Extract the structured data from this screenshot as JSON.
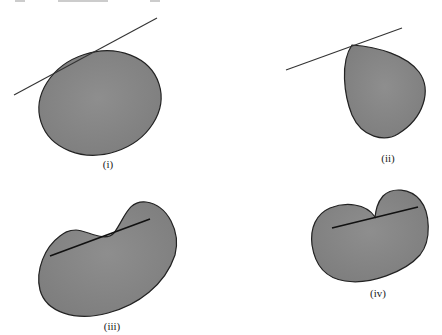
{
  "figure": {
    "fill_color": "#8c8c8c",
    "outline_color": "#222222",
    "panels": [
      {
        "id": "i",
        "label": "(i)",
        "shape": "ellipse",
        "line_type": "tangent line touching top-left of boundary"
      },
      {
        "id": "ii",
        "label": "(ii)",
        "shape": "teardrop",
        "line_type": "line through pointed apex"
      },
      {
        "id": "iii",
        "label": "(iii)",
        "shape": "kidney (non-convex)",
        "line_type": "chord partly exiting region"
      },
      {
        "id": "iv",
        "label": "(iv)",
        "shape": "heart-like (non-convex)",
        "line_type": "chord passing through notch"
      }
    ]
  }
}
